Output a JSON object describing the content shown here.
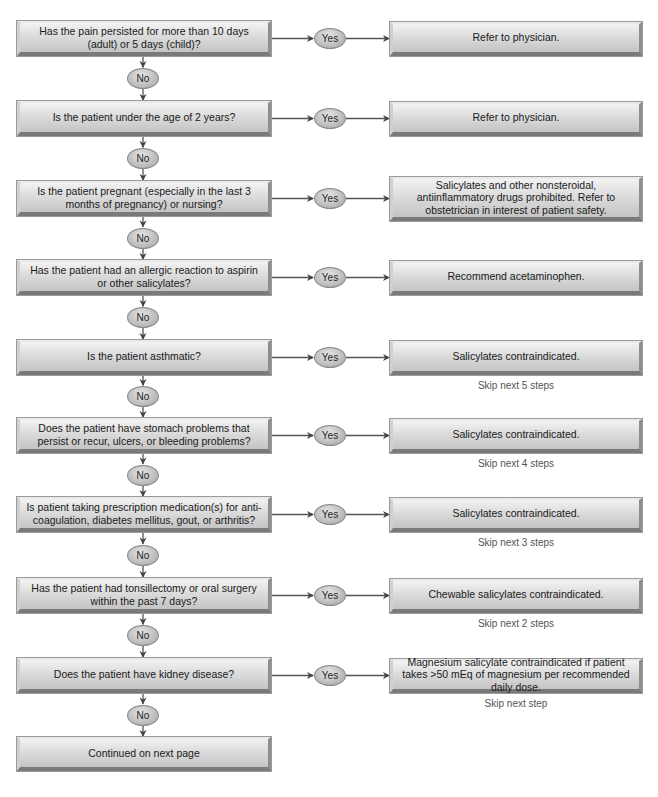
{
  "flowchart": {
    "yes_label": "Yes",
    "no_label": "No",
    "steps": [
      {
        "question": "Has the pain persisted for more than 10 days (adult) or 5 days (child)?",
        "action": "Refer to physician.",
        "skip": ""
      },
      {
        "question": "Is the patient under the age of 2 years?",
        "action": "Refer to physician.",
        "skip": ""
      },
      {
        "question": "Is the patient pregnant (especially in the last 3 months of pregnancy) or nursing?",
        "action": "Salicylates and other nonsteroidal, antiinflammatory drugs prohibited. Refer to obstetrician in interest of patient safety.",
        "skip": ""
      },
      {
        "question": "Has the patient had an allergic reaction to aspirin or other salicylates?",
        "action": "Recommend acetaminophen.",
        "skip": ""
      },
      {
        "question": "Is the patient asthmatic?",
        "action": "Salicylates contraindicated.",
        "skip": "Skip next 5 steps"
      },
      {
        "question": "Does the patient have stomach problems that persist or recur, ulcers, or bleeding problems?",
        "action": "Salicylates contraindicated.",
        "skip": "Skip next 4 steps"
      },
      {
        "question": "Is patient taking prescription medication(s) for anti-coagulation, diabetes mellitus, gout, or arthritis?",
        "action": "Salicylates contraindicated.",
        "skip": "Skip next 3 steps"
      },
      {
        "question": "Has the patient had tonsillectomy or oral surgery within the past 7 days?",
        "action": "Chewable salicylates contraindicated.",
        "skip": "Skip next 2 steps"
      },
      {
        "question": "Does the patient have kidney disease?",
        "action": "Magnesium salicylate contraindicated if patient takes >50 mEq of magnesium per recommended daily dose.",
        "skip": "Skip next step"
      }
    ],
    "end_label": "Continued on next page"
  }
}
